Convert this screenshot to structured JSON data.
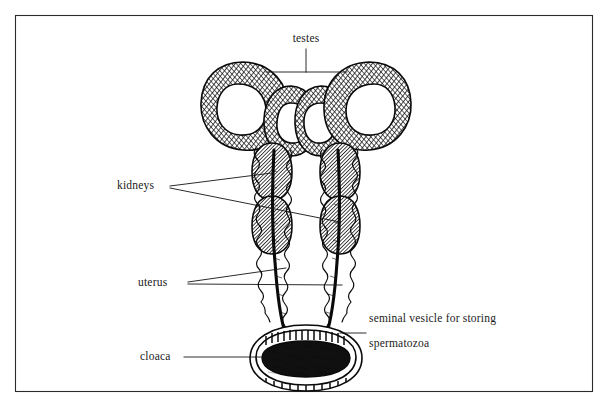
{
  "figure": {
    "style": "pen-and-ink line drawing with cross-hatching",
    "background_color": "#ffffff",
    "ink_color": "#0a0a0a",
    "frame": {
      "name": "figure-border",
      "color": "#2b2b2b",
      "x": 15,
      "y": 15,
      "width": 578,
      "height": 377
    }
  },
  "labels": [
    {
      "id": "testes",
      "text": "testes",
      "x": 286,
      "y": 42,
      "anchor": "middle",
      "leader": "bracket"
    },
    {
      "id": "kidneys",
      "text": "kidneys",
      "x": 117,
      "y": 189,
      "anchor": "start",
      "leader": "two-lines"
    },
    {
      "id": "uterus",
      "text": "uterus",
      "x": 138,
      "y": 286,
      "anchor": "start",
      "leader": "two-lines"
    },
    {
      "id": "seminal-vesicle",
      "text_line_1": "seminal vesicle for storing",
      "text_line_2": "spermatozoa",
      "x": 369,
      "y": 322,
      "anchor": "start",
      "leader": "single-line"
    },
    {
      "id": "cloaca",
      "text": "cloaca",
      "x": 140,
      "y": 360,
      "anchor": "start",
      "leader": "single-line"
    }
  ],
  "structures": [
    {
      "id": "testis-left-outer",
      "name": "testis",
      "side": "left",
      "cx": 243,
      "cy": 104
    },
    {
      "id": "testis-left-inner",
      "name": "testis",
      "side": "left",
      "cx": 287,
      "cy": 117
    },
    {
      "id": "testis-right-inner",
      "name": "testis",
      "side": "right",
      "cx": 327,
      "cy": 117
    },
    {
      "id": "testis-right-outer",
      "name": "testis",
      "side": "right",
      "cx": 369,
      "cy": 104
    },
    {
      "id": "kidney-left",
      "name": "kidney",
      "side": "left",
      "cx": 272,
      "cy": 185
    },
    {
      "id": "kidney-right",
      "name": "kidney",
      "side": "right",
      "cx": 340,
      "cy": 185
    },
    {
      "id": "uterus-left",
      "name": "uterus",
      "side": "left",
      "cx": 278,
      "cy": 285
    },
    {
      "id": "uterus-right",
      "name": "uterus",
      "side": "right",
      "cx": 334,
      "cy": 285
    },
    {
      "id": "seminal-vesicle",
      "name": "seminal vesicle",
      "side": "both",
      "cx": 306,
      "cy": 348
    },
    {
      "id": "cloaca",
      "name": "cloaca",
      "side": "center",
      "cx": 306,
      "cy": 363
    }
  ]
}
